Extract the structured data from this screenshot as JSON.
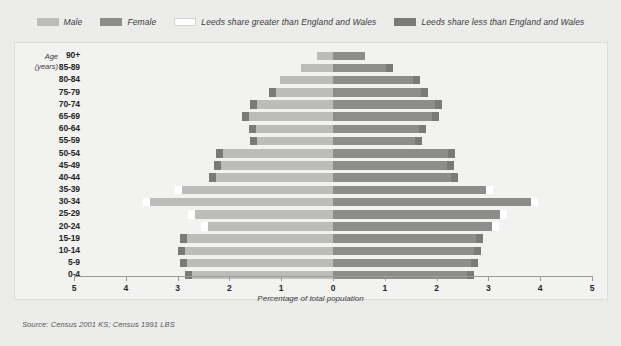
{
  "legend": {
    "items": [
      {
        "label": "Male",
        "color": "#bcbcba",
        "icon": "legend-swatch-male"
      },
      {
        "label": "Female",
        "color": "#8d8d8b",
        "icon": "legend-swatch-female"
      },
      {
        "label": "Leeds share greater than England and Wales",
        "color": "#ffffff",
        "icon": "legend-swatch-greater"
      },
      {
        "label": "Leeds share less than England and Wales",
        "color": "#7a7a78",
        "icon": "legend-swatch-less"
      }
    ]
  },
  "axis_title": {
    "line1": "Age",
    "line2": "(years)"
  },
  "source": "Source: Census 2001 KS; Census 1991 LBS",
  "chart_data": {
    "type": "bar",
    "subtype": "population-pyramid",
    "title": "",
    "xlabel": "Percentage of total population",
    "ylabel": "Age (years)",
    "xlim": [
      -5,
      5
    ],
    "xticks": [
      5,
      4,
      3,
      2,
      1,
      0,
      1,
      2,
      3,
      4,
      5
    ],
    "grid": false,
    "legend_position": "top-center",
    "categories": [
      "90+",
      "85-89",
      "80-84",
      "75-79",
      "70-74",
      "65-69",
      "60-64",
      "55-59",
      "50-54",
      "45-49",
      "40-44",
      "35-39",
      "30-34",
      "25-29",
      "20-24",
      "15-19",
      "10-14",
      "5-9",
      "0-4"
    ],
    "series": [
      {
        "name": "Male",
        "color": "#bcbcba",
        "values": [
          0.3,
          0.62,
          1.03,
          1.23,
          1.6,
          1.75,
          1.62,
          1.6,
          2.26,
          2.3,
          2.4,
          3.05,
          3.67,
          2.8,
          2.55,
          2.95,
          3.0,
          2.95,
          2.85
        ]
      },
      {
        "name": "Female",
        "color": "#8d8d8b",
        "values": [
          0.62,
          1.15,
          1.68,
          1.83,
          2.1,
          2.05,
          1.8,
          1.72,
          2.35,
          2.33,
          2.42,
          3.08,
          3.95,
          3.35,
          3.2,
          2.9,
          2.85,
          2.8,
          2.72
        ]
      }
    ],
    "comparison_markers": {
      "greater_color": "#ffffff",
      "less_color": "#7a7a78",
      "note": "End caps indicate whether the Leeds share is greater or less than the England and Wales share",
      "male": [
        null,
        null,
        null,
        "less",
        "less",
        "less",
        "less",
        "less",
        "less",
        "less",
        "less",
        "greater",
        "greater",
        "greater",
        "greater",
        "less",
        "less",
        "less",
        "less"
      ],
      "female": [
        null,
        "less",
        "less",
        "less",
        "less",
        "less",
        "less",
        "less",
        "less",
        "less",
        "less",
        "greater",
        "greater",
        "greater",
        "greater",
        "less",
        "less",
        "less",
        "less"
      ]
    }
  }
}
